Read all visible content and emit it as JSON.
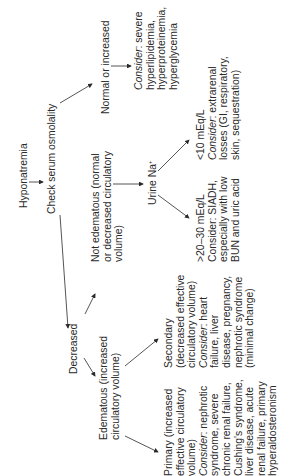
{
  "diagram": {
    "orientation": "rotated-90-ccw",
    "nodes": {
      "hyponatremia": {
        "lines": [
          "Hyponatremia"
        ]
      },
      "check_osmolality": {
        "lines": [
          "Check serum osmolality"
        ]
      },
      "normal_or_increased": {
        "lines": [
          "Normal or increased"
        ]
      },
      "consider_severe": {
        "prefix": "Consider",
        "lines": [
          ": severe",
          "hyperlipidemia,",
          "hyperproteinemia,",
          "hyperglycemia"
        ]
      },
      "decreased": {
        "lines": [
          "Decreased"
        ]
      },
      "not_edematous": {
        "lines": [
          "Not edematous (normal",
          "or decreased circulatory",
          "volume)"
        ]
      },
      "urine_na": {
        "lines": [
          "Urine Na",
          "+"
        ]
      },
      "lt10": {
        "prefix": "Consider",
        "lines": [
          "<10 mEq/L",
          ": extrarenal",
          "losses (GI, respiratory,",
          "skin, sequestration)"
        ]
      },
      "gt20": {
        "lines": [
          ">20–30 mEq/L",
          "Consider: SIADH,",
          "especially with low",
          "BUN and uric acid"
        ]
      },
      "edematous": {
        "lines": [
          "Edematous (increased",
          "circulatory volume)"
        ]
      },
      "secondary": {
        "prefix": "Consider",
        "lines": [
          "Secondary",
          "(decreased effective",
          "circulatory volume)",
          ": heart",
          "failure, liver",
          "disease, pregnancy,",
          "nephrotic syndrome",
          "(minimal change)"
        ]
      },
      "primary": {
        "prefix": "Consider",
        "lines": [
          "Primary (increased",
          "effective circulatory",
          "volume)",
          ": nephrotic",
          "syndrome, severe",
          "chronic renal failure,",
          "Cushing's syndrome,",
          "liver disease, acute",
          "renal failure, primary",
          "hyperaldosteronism"
        ]
      }
    },
    "edges": [
      [
        "hyponatremia",
        "check_osmolality"
      ],
      [
        "check_osmolality",
        "normal_or_increased"
      ],
      [
        "check_osmolality",
        "decreased"
      ],
      [
        "normal_or_increased",
        "consider_severe"
      ],
      [
        "decreased",
        "not_edematous"
      ],
      [
        "decreased",
        "edematous"
      ],
      [
        "not_edematous",
        "urine_na"
      ],
      [
        "urine_na",
        "lt10"
      ],
      [
        "urine_na",
        "gt20"
      ],
      [
        "edematous",
        "secondary"
      ],
      [
        "edematous",
        "primary"
      ]
    ],
    "colors": {
      "text": "#2a2a2a",
      "arrow": "#2a2a2a",
      "background": "#ffffff"
    }
  }
}
